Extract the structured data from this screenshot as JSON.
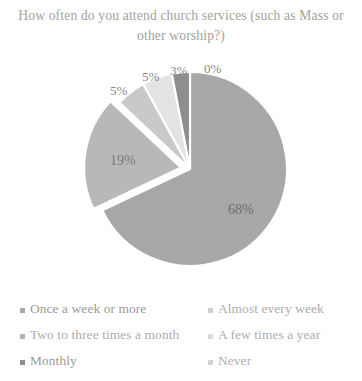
{
  "chart_data": {
    "type": "pie",
    "title": "How often do you attend church services (such as Mass or other worship?)",
    "title_line1": "How often do you attend church services (such",
    "title_line2": "as Mass or other worship?)",
    "xlabel": "",
    "ylabel": "",
    "legend_position": "bottom",
    "grid": false,
    "start_angle_deg": 0,
    "direction": "clockwise",
    "categories": [
      "Once a week or more",
      "Almost every week",
      "Two to three times a month",
      "A few times a year",
      "Monthly",
      "Never"
    ],
    "values": [
      68,
      19,
      5,
      5,
      3,
      0
    ],
    "data_labels": [
      "68%",
      "19%",
      "5%",
      "5%",
      "3%",
      "0%"
    ],
    "colors": [
      "#a8a8a8",
      "#b8b8b8",
      "#c9c9c9",
      "#e3e3e3",
      "#8e8e8e",
      "#d4d4d4"
    ],
    "exploded_slices": [
      "Almost every week"
    ],
    "slices": [
      {
        "label": "Once a week or more",
        "value": 68,
        "display": "68%",
        "color": "#a8a8a8"
      },
      {
        "label": "Almost every week",
        "value": 19,
        "display": "19%",
        "color": "#b8b8b8"
      },
      {
        "label": "Two to three times a month",
        "value": 5,
        "display": "5%",
        "color": "#c9c9c9"
      },
      {
        "label": "A few times a year",
        "value": 5,
        "display": "5%",
        "color": "#e3e3e3"
      },
      {
        "label": "Monthly",
        "value": 3,
        "display": "3%",
        "color": "#8e8e8e"
      },
      {
        "label": "Never",
        "value": 0,
        "display": "0%",
        "color": "#d4d4d4"
      }
    ]
  },
  "labels": {
    "pct_68": "68%",
    "pct_19": "19%",
    "pct_5a": "5%",
    "pct_5b": "5%",
    "pct_3": "3%",
    "pct_0": "0%"
  },
  "legend": {
    "rows": [
      {
        "left": "Once a week or more",
        "right": "Almost every week"
      },
      {
        "left": "Two to three times a month",
        "right": "A few times a year"
      },
      {
        "left": "Monthly",
        "right": "Never"
      }
    ]
  }
}
